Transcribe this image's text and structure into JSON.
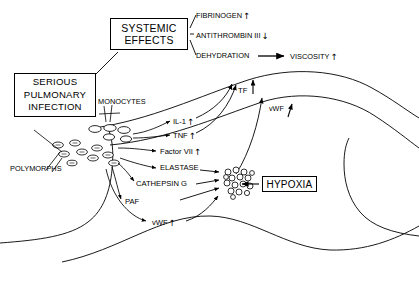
{
  "diagram": {
    "type": "flow-diagram",
    "background_color": "#ffffff",
    "line_color": "#000000",
    "boxes": [
      {
        "id": "systemic_effects",
        "line1": "SYSTEMIC",
        "line2": "EFFECTS"
      },
      {
        "id": "serious_infection",
        "line1": "SERIOUS",
        "line2": "PULMONARY",
        "line3": "INFECTION"
      },
      {
        "id": "hypoxia",
        "line1": "HYPOXIA"
      }
    ],
    "nodes": {
      "fibrinogen": {
        "label": "FIBRINOGEN",
        "change": "up"
      },
      "antithrombin": {
        "label": "ANTITHROMBIN III",
        "change": "down"
      },
      "dehydration": {
        "label": "DEHYDRATION",
        "change": "none"
      },
      "viscosity": {
        "label": "VISCOSITY",
        "change": "up"
      },
      "monocytes": {
        "label": "MONOCYTES",
        "change": "none"
      },
      "polymorphs": {
        "label": "POLYMORPHS",
        "change": "none"
      },
      "tissue_factor": {
        "label": "TF",
        "change": "up"
      },
      "vwf_top": {
        "label": "vWF",
        "change": "up"
      },
      "il1": {
        "label": "IL-1",
        "change": "up"
      },
      "tnf": {
        "label": "TNF",
        "change": "up"
      },
      "factor_vii": {
        "label": "Factor VII",
        "change": "up"
      },
      "elastase": {
        "label": "ELASTASE",
        "change": "none"
      },
      "cathepsin_g": {
        "label": "CATHEPSIN G",
        "change": "none"
      },
      "paf": {
        "label": "PAF",
        "change": "none"
      },
      "vwf_bottom": {
        "label": "vWF",
        "change": "up"
      }
    },
    "glyphs": {
      "arrow_up": "↑",
      "arrow_down": "↓"
    }
  }
}
